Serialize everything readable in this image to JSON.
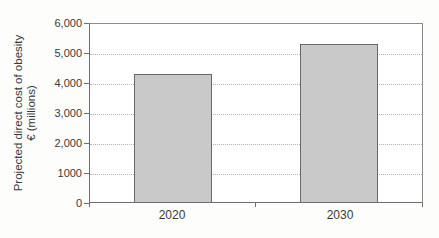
{
  "chart_data": {
    "type": "bar",
    "categories": [
      "2020",
      "2030"
    ],
    "values": [
      4330,
      5330
    ],
    "title": "",
    "xlabel": "",
    "ylabel_line1": "Projected direct cost of obesity",
    "ylabel_line2": "€ (millions)",
    "ylim": [
      0,
      6000
    ],
    "ytick_interval": 1000,
    "ytick_labels": [
      "6,000",
      "5,000",
      "4,000",
      "3,000",
      "2,000",
      "1000",
      "0"
    ],
    "grid": "horizontal dotted lines at each 1000, gridlines on",
    "legend_position": "none",
    "bar_fill_color": "#c9c9c9",
    "bar_border_color": "#686868",
    "plot_border_color": "#8c8c8c"
  }
}
